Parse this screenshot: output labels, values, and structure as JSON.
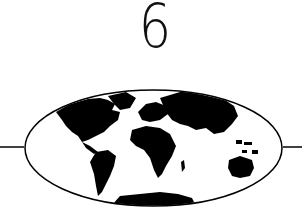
{
  "chapter": {
    "number": "6"
  },
  "emblem": {
    "icon": "world-map-oval-icon",
    "ink_color": "#000000",
    "background": "#ffffff"
  }
}
